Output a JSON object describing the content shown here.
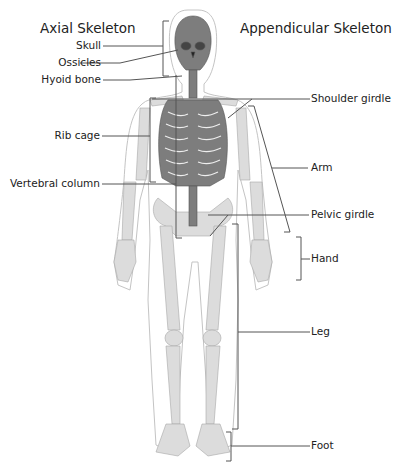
{
  "diagram": {
    "headings": {
      "axial": "Axial Skeleton",
      "appendicular": "Appendicular Skeleton"
    },
    "axial_labels": [
      {
        "id": "skull",
        "text": "Skull"
      },
      {
        "id": "ossicles",
        "text": "Ossicles"
      },
      {
        "id": "hyoid",
        "text": "Hyoid bone"
      },
      {
        "id": "rib-cage",
        "text": "Rib cage"
      },
      {
        "id": "vertebral-column",
        "text": "Vertebral column"
      }
    ],
    "appendicular_labels": [
      {
        "id": "shoulder-girdle",
        "text": "Shoulder girdle"
      },
      {
        "id": "arm",
        "text": "Arm"
      },
      {
        "id": "pelvic-girdle",
        "text": "Pelvic girdle"
      },
      {
        "id": "hand",
        "text": "Hand"
      },
      {
        "id": "leg",
        "text": "Leg"
      },
      {
        "id": "foot",
        "text": "Foot"
      }
    ],
    "colors": {
      "axial_bone": "#7a7a7a",
      "appendicular_bone": "#d4d4d4",
      "body_outline": "#bdbdbd",
      "leader_line": "#555555"
    }
  }
}
